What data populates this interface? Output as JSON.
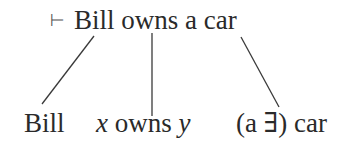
{
  "diagram": {
    "root": {
      "turnstile": "⊢",
      "sentence": "Bill owns a car"
    },
    "children": [
      {
        "label": "Bill"
      },
      {
        "var1": "x",
        "middle": " owns ",
        "var2": "y"
      },
      {
        "label": "(a ∃) car"
      }
    ],
    "edges": [
      {
        "from": "root",
        "to": "children.0"
      },
      {
        "from": "root",
        "to": "children.1"
      },
      {
        "from": "root",
        "to": "children.2"
      }
    ],
    "colors": {
      "text": "#2a2a2a",
      "line": "#3a3a3a"
    }
  }
}
